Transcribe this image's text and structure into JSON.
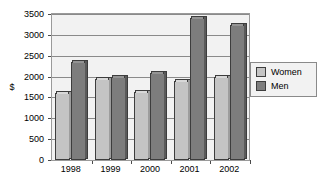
{
  "chart_data": {
    "type": "bar",
    "title": "",
    "xlabel": "",
    "ylabel": "$",
    "categories": [
      "1998",
      "1999",
      "2000",
      "2001",
      "2002"
    ],
    "series": [
      {
        "name": "Women",
        "color": "#c4c4c4",
        "values": [
          1600,
          1950,
          1620,
          1900,
          1980
        ]
      },
      {
        "name": "Men",
        "color": "#7d7d7d",
        "values": [
          2350,
          1980,
          2080,
          3400,
          3230
        ]
      }
    ],
    "ylim": [
      0,
      3500
    ],
    "ytick_step": 500,
    "yticks": [
      "3500",
      "3000",
      "2500",
      "2000",
      "1500",
      "1000",
      "500",
      "0"
    ],
    "grid": true,
    "legend_position": "right"
  },
  "legend": {
    "items": [
      {
        "label": "Women"
      },
      {
        "label": "Men"
      }
    ]
  }
}
